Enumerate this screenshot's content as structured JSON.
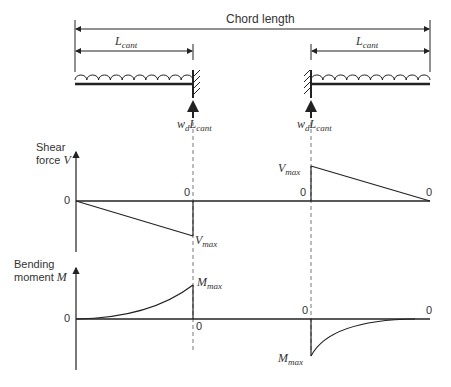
{
  "beam": {
    "chord_label": "Chord length",
    "left_span_label": "L",
    "left_span_sub": "cant",
    "right_span_label": "L",
    "right_span_sub": "cant",
    "left_reaction": {
      "w": "w",
      "w_sub": "d",
      "L": "L",
      "L_sub": "cant"
    },
    "right_reaction": {
      "w": "w",
      "w_sub": "d",
      "L": "L",
      "L_sub": "cant"
    }
  },
  "shear": {
    "axis_label_line1": "Shear",
    "axis_label_line2": "force ",
    "axis_var": "V",
    "zero_left": "0",
    "zero_mid_left": "0",
    "zero_mid_right": "0",
    "zero_right": "0",
    "vmax_left": "V",
    "vmax_left_sub": "max",
    "vmax_right": "V",
    "vmax_right_sub": "max"
  },
  "moment": {
    "axis_label_line1": "Bending",
    "axis_label_line2": "moment ",
    "axis_var": "M",
    "zero_left": "0",
    "zero_mid_left": "0",
    "zero_mid_right": "0",
    "zero_right": "0",
    "mmax_left": "M",
    "mmax_left_sub": "max",
    "mmax_right": "M",
    "mmax_right_sub": "max"
  },
  "colors": {
    "line": "#222222",
    "dash": "#555555"
  }
}
